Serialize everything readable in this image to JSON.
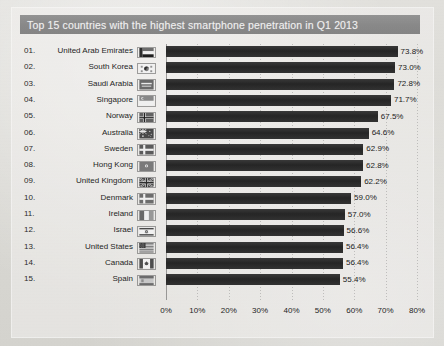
{
  "chart_title": "Top 15 countries with the highest smartphone penetration in Q1 2013",
  "colors": {
    "title_band": "#8d8d8d",
    "title_text": "#f2f2f2",
    "bar": "#2b2b2b",
    "background": "#dcdbd6",
    "axis_text": "#1f1f1f"
  },
  "chart_data": {
    "type": "bar",
    "orientation": "horizontal",
    "title": "Top 15 countries with the highest smartphone penetration in Q1 2013",
    "xlabel": "",
    "ylabel": "",
    "xlim": [
      0,
      80
    ],
    "xticks": [
      "0%",
      "10%",
      "20%",
      "30%",
      "40%",
      "50%",
      "60%",
      "70%",
      "80%"
    ],
    "xtick_values": [
      0,
      10,
      20,
      30,
      40,
      50,
      60,
      70,
      80
    ],
    "grid": true,
    "legend": false,
    "value_suffix": "%",
    "categories": [
      "United Arab Emirates",
      "South Korea",
      "Saudi Arabia",
      "Singapore",
      "Norway",
      "Australia",
      "Sweden",
      "Hong Kong",
      "United Kingdom",
      "Denmark",
      "Ireland",
      "Israel",
      "United States",
      "Canada",
      "Spain"
    ],
    "values": [
      73.8,
      73.0,
      72.8,
      71.7,
      67.5,
      64.6,
      62.9,
      62.8,
      62.2,
      59.0,
      57.0,
      56.6,
      56.4,
      56.4,
      55.4
    ]
  },
  "rows": [
    {
      "rank": "01.",
      "country": "United Arab Emirates",
      "value": 73.8,
      "label": "73.8%",
      "flag": "ae"
    },
    {
      "rank": "02.",
      "country": "South Korea",
      "value": 73.0,
      "label": "73.0%",
      "flag": "kr"
    },
    {
      "rank": "03.",
      "country": "Saudi Arabia",
      "value": 72.8,
      "label": "72.8%",
      "flag": "sa"
    },
    {
      "rank": "04.",
      "country": "Singapore",
      "value": 71.7,
      "label": "71.7%",
      "flag": "sg"
    },
    {
      "rank": "05.",
      "country": "Norway",
      "value": 67.5,
      "label": "67.5%",
      "flag": "no"
    },
    {
      "rank": "06.",
      "country": "Australia",
      "value": 64.6,
      "label": "64.6%",
      "flag": "au"
    },
    {
      "rank": "07.",
      "country": "Sweden",
      "value": 62.9,
      "label": "62.9%",
      "flag": "se"
    },
    {
      "rank": "08.",
      "country": "Hong Kong",
      "value": 62.8,
      "label": "62.8%",
      "flag": "hk"
    },
    {
      "rank": "09.",
      "country": "United Kingdom",
      "value": 62.2,
      "label": "62.2%",
      "flag": "gb"
    },
    {
      "rank": "10.",
      "country": "Denmark",
      "value": 59.0,
      "label": "59.0%",
      "flag": "dk"
    },
    {
      "rank": "11.",
      "country": "Ireland",
      "value": 57.0,
      "label": "57.0%",
      "flag": "ie"
    },
    {
      "rank": "12.",
      "country": "Israel",
      "value": 56.6,
      "label": "56.6%",
      "flag": "il"
    },
    {
      "rank": "13.",
      "country": "United States",
      "value": 56.4,
      "label": "56.4%",
      "flag": "us"
    },
    {
      "rank": "14.",
      "country": "Canada",
      "value": 56.4,
      "label": "56.4%",
      "flag": "ca"
    },
    {
      "rank": "15.",
      "country": "Spain",
      "value": 55.4,
      "label": "55.4%",
      "flag": "es"
    }
  ]
}
